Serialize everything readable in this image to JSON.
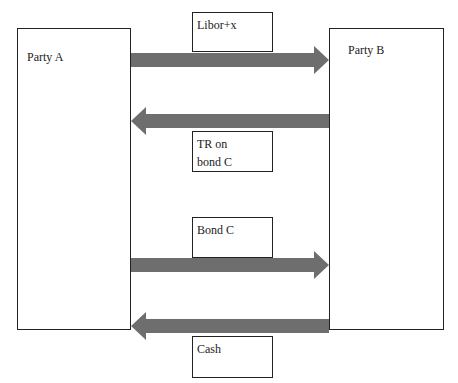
{
  "diagram": {
    "parties": [
      {
        "id": "party-a",
        "label": "Party A"
      },
      {
        "id": "party-b",
        "label": "Party B"
      }
    ],
    "flows": [
      {
        "from": "Party A",
        "to": "Party B",
        "label": "Libor+x"
      },
      {
        "from": "Party B",
        "to": "Party A",
        "label_line1": "TR on",
        "label_line2": "bond C"
      },
      {
        "from": "Party A",
        "to": "Party B",
        "label": "Bond C"
      },
      {
        "from": "Party B",
        "to": "Party A",
        "label": "Cash"
      }
    ],
    "colors": {
      "arrow": "#6e6e6e",
      "border": "#222222"
    }
  }
}
